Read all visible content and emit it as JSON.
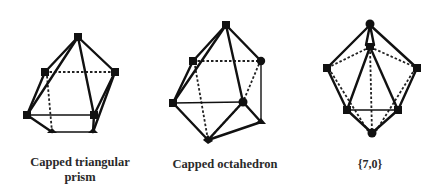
{
  "figures": [
    {
      "id": "capped-triangular-prism",
      "label_line1": "Capped triangular",
      "label_line2": "prism"
    },
    {
      "id": "capped-octahedron",
      "label": "Capped octahedron"
    },
    {
      "id": "seven-zero",
      "label": "{7,0}"
    }
  ]
}
